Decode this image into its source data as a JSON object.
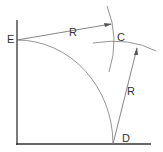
{
  "diagram": {
    "points": [
      {
        "label": "E",
        "x": 17,
        "y": 40
      },
      {
        "label": "C",
        "x": 120,
        "y": 43
      },
      {
        "label": "D",
        "x": 113,
        "y": 144
      }
    ],
    "labels": {
      "E": "E",
      "C": "C",
      "D": "D",
      "R_top": "R",
      "R_right": "R"
    },
    "colors": {
      "axis": "#333333",
      "arc": "#777777",
      "line": "#666666"
    }
  }
}
